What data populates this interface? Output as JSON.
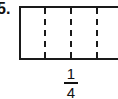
{
  "problem": {
    "number_label": "5.",
    "diagram": {
      "shape": "rectangle",
      "divisions": 4,
      "divider_style": "dashed",
      "divider_x": [
        45,
        71,
        97
      ]
    },
    "fraction": {
      "numerator": "1",
      "denominator": "4"
    }
  },
  "colors": {
    "stroke": "#1a1a1a",
    "background": "#ffffff"
  }
}
